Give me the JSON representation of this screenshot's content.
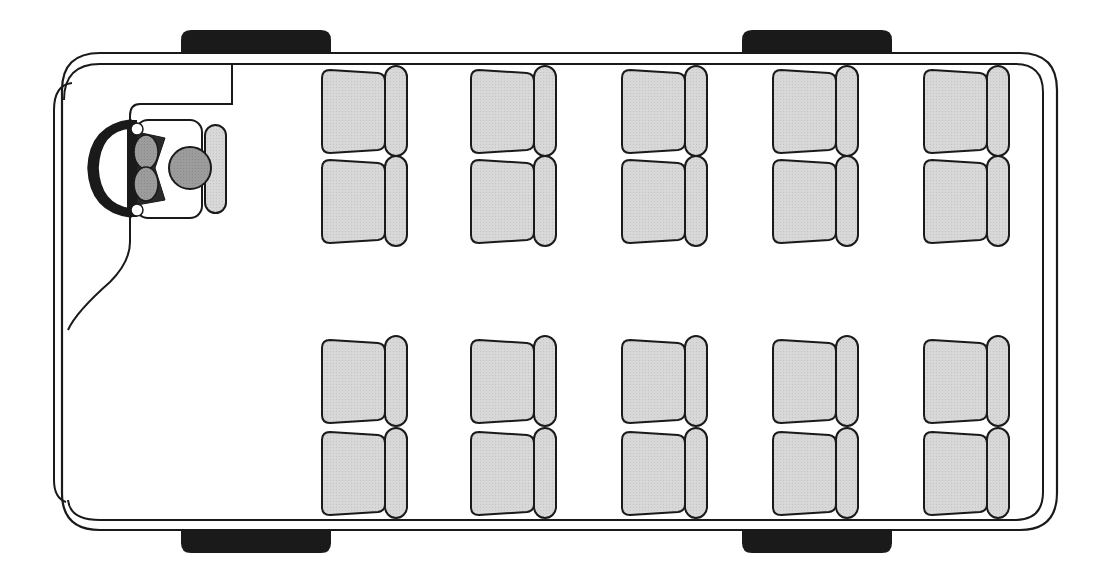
{
  "diagram": {
    "title": "Minibus seating layout (top view)",
    "colors": {
      "outline": "#1a1a1a",
      "seat_fill": "#d6d6d6",
      "driver_fill": "#9a9a9a",
      "wheel": "#1a1a1a",
      "background": "#ffffff"
    },
    "driver": {
      "label": "Driver seat with steering wheel"
    },
    "seat_columns_x": [
      322,
      471,
      622,
      773,
      924
    ],
    "seat_rows_y": [
      68,
      158,
      338,
      430
    ],
    "passenger_seat_count": 20,
    "wheels": [
      {
        "id": "front-left",
        "x": 181,
        "y": 30
      },
      {
        "id": "rear-left",
        "x": 742,
        "y": 30
      },
      {
        "id": "front-right",
        "x": 181,
        "y": 530
      },
      {
        "id": "rear-right",
        "x": 742,
        "y": 530
      }
    ]
  }
}
